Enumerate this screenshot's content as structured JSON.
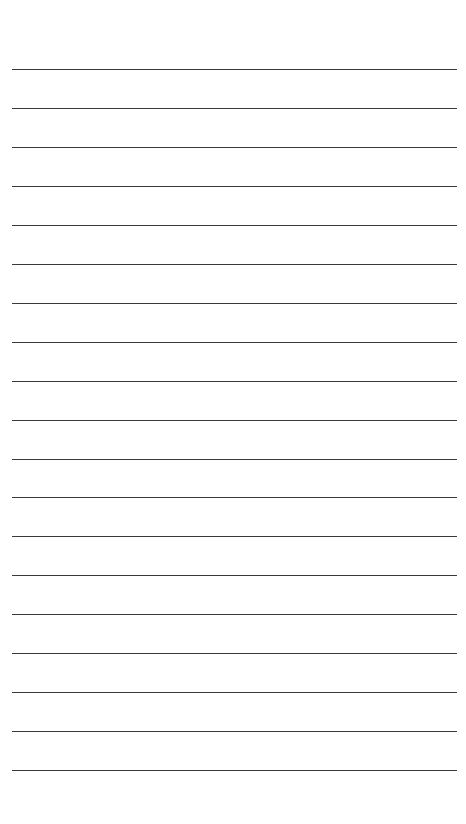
{
  "page": {
    "type": "lined-paper",
    "background": "#ffffff",
    "line_color": "#3a3a3a",
    "line_count": 19,
    "first_line_y": 69,
    "line_spacing": 38.95,
    "line_left": 12,
    "line_width": 445
  }
}
